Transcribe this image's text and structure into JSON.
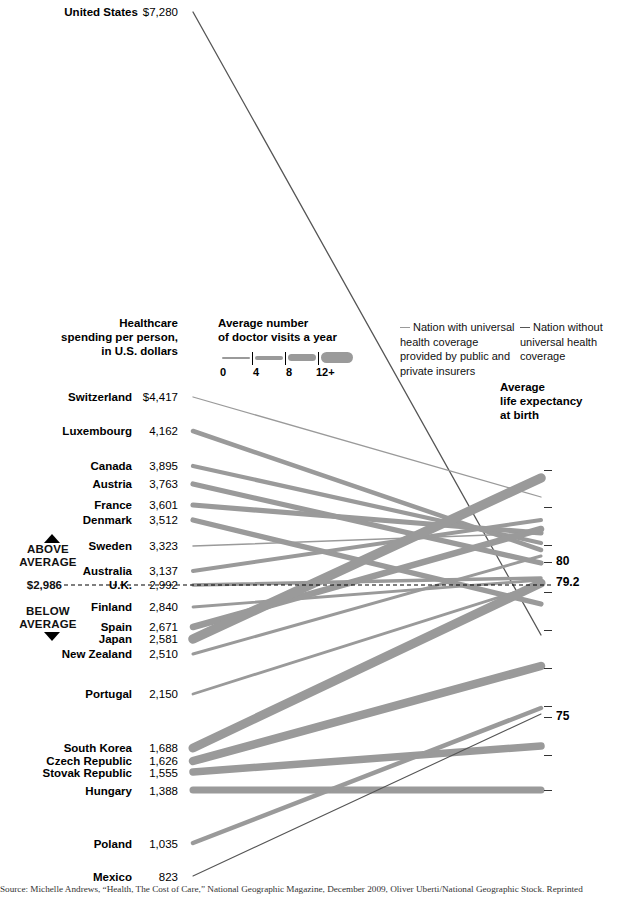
{
  "headers": {
    "spending": "Healthcare\nspending per person,\nin U.S. dollars",
    "visits": "Average number\nof doctor visits a year",
    "life": "Average\nlife expectancy\nat birth"
  },
  "visits_legend": {
    "ticks": [
      "0",
      "4",
      "8",
      "12+"
    ]
  },
  "legend": {
    "universal": "Nation with universal health coverage provided by public and private insurers",
    "non_universal": "Nation without universal health coverage",
    "universal_color": "#9a9a9a",
    "non_universal_color": "#555555"
  },
  "average": {
    "above_label": "ABOVE\nAVERAGE",
    "below_label": "BELOW\nAVERAGE",
    "spend_value": "$2,986",
    "life_value": "79.2"
  },
  "right_axis": {
    "labels": [
      {
        "text": "80",
        "y": 562
      },
      {
        "text": "79.2",
        "y": 583
      },
      {
        "text": "75",
        "y": 717
      }
    ],
    "ticks_y": [
      470,
      507,
      545,
      562,
      592,
      630,
      668,
      706,
      717,
      755,
      790
    ]
  },
  "source": "Source: Michelle Andrews, “Health, The Cost of Care,” National Geographic Magazine, December 2009, Oliver Uberti/National Geographic Stock. Reprinted",
  "chart_data": {
    "type": "line",
    "xlabel": "",
    "ylabel": "Healthcare spending per person, in U.S. dollars",
    "left_axis_label": "Healthcare spending per person, in U.S. dollars",
    "right_axis_label": "Average life expectancy at birth",
    "right_axis_ticks": [
      82,
      81,
      80,
      79.2,
      78,
      77,
      76,
      75,
      74,
      73
    ],
    "average_spending": 2986,
    "average_life_expectancy": 79.2,
    "line_width_encodes": "Average number of doctor visits a year",
    "line_width_scale": [
      "0",
      "4",
      "8",
      "12+"
    ],
    "series": [
      {
        "country": "United States",
        "spending_label": "$7,280",
        "spending": 7280,
        "life_expectancy": 78.2,
        "doctor_visits": 4,
        "universal": false,
        "y_left": 12,
        "y_right": 635,
        "width": 1.3
      },
      {
        "country": "Switzerland",
        "spending_label": "$4,417",
        "spending": 4417,
        "life_expectancy": 82.0,
        "doctor_visits": 4,
        "universal": true,
        "y_left": 397,
        "y_right": 497,
        "width": 1.3
      },
      {
        "country": "Luxembourg",
        "spending_label": "4,162",
        "spending": 4162,
        "life_expectancy": 80.4,
        "doctor_visits": 7,
        "universal": true,
        "y_left": 431,
        "y_right": 550,
        "width": 4.5
      },
      {
        "country": "Canada",
        "spending_label": "3,895",
        "spending": 3895,
        "life_expectancy": 80.7,
        "doctor_visits": 6,
        "universal": true,
        "y_left": 466,
        "y_right": 543,
        "width": 4.2
      },
      {
        "country": "Austria",
        "spending_label": "3,763",
        "spending": 3763,
        "life_expectancy": 80.0,
        "doctor_visits": 7,
        "universal": true,
        "y_left": 484,
        "y_right": 563,
        "width": 5.2
      },
      {
        "country": "France",
        "spending_label": "3,601",
        "spending": 3601,
        "life_expectancy": 81.0,
        "doctor_visits": 7,
        "universal": true,
        "y_left": 505,
        "y_right": 533,
        "width": 5.2
      },
      {
        "country": "Denmark",
        "spending_label": "3,512",
        "spending": 3512,
        "life_expectancy": 78.8,
        "doctor_visits": 7,
        "universal": true,
        "y_left": 520,
        "y_right": 604,
        "width": 5.2
      },
      {
        "country": "Sweden",
        "spending_label": "3,323",
        "spending": 3323,
        "life_expectancy": 81.0,
        "doctor_visits": 3,
        "universal": true,
        "y_left": 546,
        "y_right": 533,
        "width": 1.5
      },
      {
        "country": "Australia",
        "spending_label": "3,137",
        "spending": 3137,
        "life_expectancy": 81.4,
        "doctor_visits": 6,
        "universal": true,
        "y_left": 571,
        "y_right": 520,
        "width": 4.0
      },
      {
        "country": "U.K.",
        "spending_label": "2,992",
        "spending": 2992,
        "life_expectancy": 79.5,
        "doctor_visits": 5,
        "universal": true,
        "y_left": 585,
        "y_right": 578,
        "width": 3.5
      },
      {
        "country": "Finland",
        "spending_label": "2,840",
        "spending": 2840,
        "life_expectancy": 79.5,
        "doctor_visits": 4,
        "universal": true,
        "y_left": 607,
        "y_right": 580,
        "width": 2.8
      },
      {
        "country": "Spain",
        "spending_label": "2,671",
        "spending": 2671,
        "life_expectancy": 81.1,
        "doctor_visits": 9,
        "universal": true,
        "y_left": 627,
        "y_right": 529,
        "width": 6.5
      },
      {
        "country": "Japan",
        "spending_label": "2,581",
        "spending": 2581,
        "life_expectancy": 82.6,
        "doctor_visits": 14,
        "universal": true,
        "y_left": 639,
        "y_right": 478,
        "width": 9.5
      },
      {
        "country": "New Zealand",
        "spending_label": "2,510",
        "spending": 2510,
        "life_expectancy": 80.2,
        "doctor_visits": 4,
        "universal": true,
        "y_left": 654,
        "y_right": 556,
        "width": 3.0
      },
      {
        "country": "Portugal",
        "spending_label": "2,150",
        "spending": 2150,
        "life_expectancy": 79.3,
        "doctor_visits": 4,
        "universal": true,
        "y_left": 694,
        "y_right": 584,
        "width": 2.8
      },
      {
        "country": "South Korea",
        "spending_label": "1,688",
        "spending": 1688,
        "life_expectancy": 79.4,
        "doctor_visits": 15,
        "universal": true,
        "y_left": 748,
        "y_right": 583,
        "width": 9.0
      },
      {
        "country": "Czech Republic",
        "spending_label": "1,626",
        "spending": 1626,
        "life_expectancy": 77.0,
        "doctor_visits": 13,
        "universal": true,
        "y_left": 761,
        "y_right": 666,
        "width": 8.5
      },
      {
        "country": "Stovak Republic",
        "spending_label": "1,555",
        "spending": 1555,
        "life_expectancy": 74.6,
        "doctor_visits": 12,
        "universal": true,
        "y_left": 772,
        "y_right": 746,
        "width": 7.5
      },
      {
        "country": "Hungary",
        "spending_label": "1,388",
        "spending": 1388,
        "life_expectancy": 73.3,
        "doctor_visits": 12,
        "universal": true,
        "y_left": 790,
        "y_right": 790,
        "width": 7.0
      },
      {
        "country": "Poland",
        "spending_label": "1,035",
        "spending": 1035,
        "life_expectancy": 75.4,
        "doctor_visits": 7,
        "universal": true,
        "y_left": 843,
        "y_right": 708,
        "width": 4.5
      },
      {
        "country": "Mexico",
        "spending_label": "823",
        "spending": 823,
        "life_expectancy": 75.0,
        "doctor_visits": 3,
        "universal": false,
        "y_left": 876,
        "y_right": 714,
        "width": 1.1
      }
    ]
  }
}
